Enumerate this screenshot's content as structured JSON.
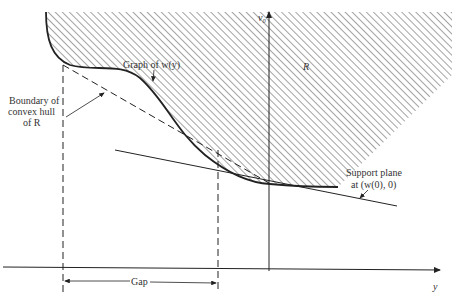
{
  "labels": {
    "graph": "Graph of w(y)",
    "boundary_line1": "Boundary of",
    "boundary_line2": "convex hull",
    "boundary_line3": "of R",
    "region": "R",
    "vaxis": "v₀",
    "haxis": "y",
    "support_line1": "Support plane",
    "support_line2": "at (w(0), 0)",
    "gap": "Gap"
  },
  "colors": {
    "ink": "#222222",
    "hatch": "#555555",
    "background": "#ffffff"
  }
}
